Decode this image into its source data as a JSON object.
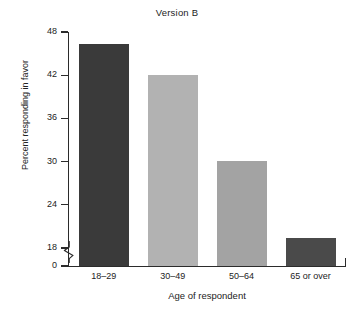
{
  "chart_data": {
    "type": "bar",
    "title": "Version B",
    "xlabel": "Age of respondent",
    "ylabel": "Percent responding in favor",
    "categories": [
      "18–29",
      "30–49",
      "50–64",
      "65 or over"
    ],
    "values": [
      46.3,
      42.0,
      30.1,
      19.4
    ],
    "bar_colors": [
      "#3a3a3a",
      "#b2b2b2",
      "#a3a3a3",
      "#4a4a4a"
    ],
    "ylim": [
      0,
      48
    ],
    "axis_break": true,
    "axis_break_between": [
      0,
      18
    ],
    "grid": false,
    "legend": "none",
    "yticks": [
      {
        "value": 48,
        "label": "48"
      },
      {
        "value": 42,
        "label": "42"
      },
      {
        "value": 36,
        "label": "36"
      },
      {
        "value": 30,
        "label": "30"
      },
      {
        "value": 24,
        "label": "24"
      },
      {
        "value": 18,
        "label": "18"
      },
      {
        "value": 0,
        "label": "0"
      }
    ]
  },
  "axes": {
    "title": "Version B",
    "y_axis_title": "Percent responding in favor",
    "x_axis_title": "Age of respondent",
    "y_tick_labels": [
      "48",
      "42",
      "36",
      "30",
      "24",
      "18",
      "0"
    ],
    "x_tick_labels": [
      "18–29",
      "30–49",
      "50–64",
      "65 or over"
    ]
  },
  "colors": {
    "axis": "#2b2b2b",
    "text": "#232323",
    "background": "#ffffff",
    "bar_dark": "#3a3a3a",
    "bar_light": "#b2b2b2",
    "bar_medium": "#a3a3a3",
    "bar_dark_2": "#4a4a4a"
  }
}
